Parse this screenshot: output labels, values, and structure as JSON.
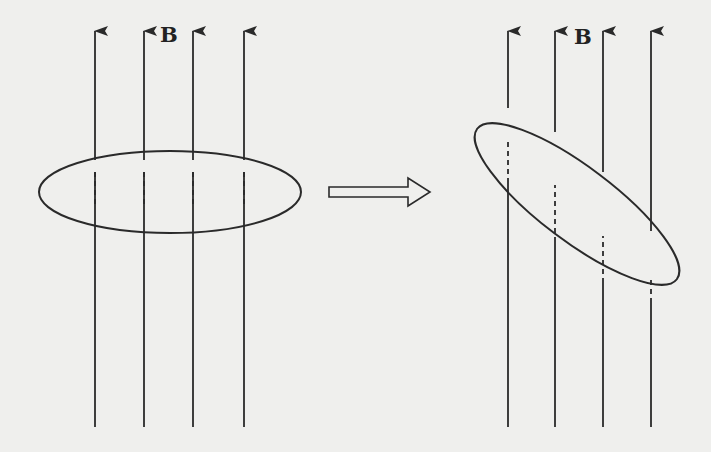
{
  "diagram": {
    "colors": {
      "background": "#efefed",
      "stroke": "#2a2a2a"
    },
    "left_panel": {
      "field_label": "B",
      "field_lines_x": [
        95,
        144,
        193,
        244
      ],
      "line_top_y": 30,
      "line_bottom_y": 427,
      "loop": {
        "cx": 170,
        "cy": 192,
        "rx": 131,
        "ry": 41,
        "rotation_deg": 0
      }
    },
    "transition_arrow": {
      "direction": "right",
      "style": "hollow-block-arrow"
    },
    "right_panel": {
      "field_label": "B",
      "field_lines_x": [
        508,
        555,
        603,
        651
      ],
      "line_top_y": 30,
      "line_bottom_y": 427,
      "loop": {
        "cx": 577,
        "cy": 204,
        "rx": 125,
        "ry": 37,
        "rotation_deg": 37
      }
    }
  }
}
